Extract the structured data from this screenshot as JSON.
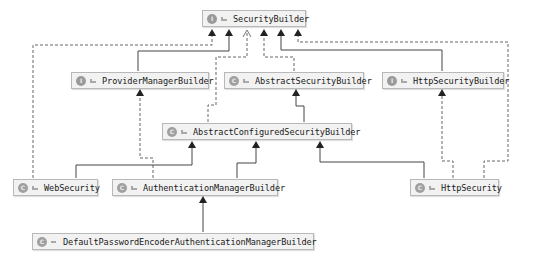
{
  "diagram": {
    "type": "uml-class-hierarchy",
    "colors": {
      "node_bg": "#f2f2f2",
      "node_border": "#b8b8b8",
      "edge": "#333333",
      "dashed_edge": "#555555"
    },
    "nodes": [
      {
        "id": "SecurityBuilder",
        "label": "SecurityBuilder",
        "kind": "interface",
        "kind_glyph": "I"
      },
      {
        "id": "ProviderManagerBuilder",
        "label": "ProviderManagerBuilder",
        "kind": "interface",
        "kind_glyph": "I"
      },
      {
        "id": "AbstractSecurityBuilder",
        "label": "AbstractSecurityBuilder",
        "kind": "abstract-class",
        "kind_glyph": "C"
      },
      {
        "id": "HttpSecurityBuilder",
        "label": "HttpSecurityBuilder",
        "kind": "interface",
        "kind_glyph": "I"
      },
      {
        "id": "AbstractConfiguredSecurityBuilder",
        "label": "AbstractConfiguredSecurityBuilder",
        "kind": "abstract-class",
        "kind_glyph": "C"
      },
      {
        "id": "WebSecurity",
        "label": "WebSecurity",
        "kind": "final-class",
        "kind_glyph": "C"
      },
      {
        "id": "AuthenticationManagerBuilder",
        "label": "AuthenticationManagerBuilder",
        "kind": "class",
        "kind_glyph": "C"
      },
      {
        "id": "HttpSecurity",
        "label": "HttpSecurity",
        "kind": "final-class",
        "kind_glyph": "C"
      },
      {
        "id": "DefaultPasswordEncoderAuthenticationManagerBuilder",
        "label": "DefaultPasswordEncoderAuthenticationManagerBuilder",
        "kind": "inner-class",
        "kind_glyph": "C"
      }
    ],
    "edges": [
      {
        "from": "WebSecurity",
        "to": "SecurityBuilder",
        "relation": "implements",
        "style": "dashed"
      },
      {
        "from": "ProviderManagerBuilder",
        "to": "SecurityBuilder",
        "relation": "extends",
        "style": "solid"
      },
      {
        "from": "AbstractConfiguredSecurityBuilder",
        "to": "SecurityBuilder",
        "relation": "implements",
        "style": "dashed"
      },
      {
        "from": "AbstractSecurityBuilder",
        "to": "SecurityBuilder",
        "relation": "implements",
        "style": "dashed"
      },
      {
        "from": "HttpSecurityBuilder",
        "to": "SecurityBuilder",
        "relation": "extends",
        "style": "solid"
      },
      {
        "from": "HttpSecurity",
        "to": "SecurityBuilder",
        "relation": "implements",
        "style": "dashed"
      },
      {
        "from": "AuthenticationManagerBuilder",
        "to": "ProviderManagerBuilder",
        "relation": "implements",
        "style": "dashed"
      },
      {
        "from": "AbstractConfiguredSecurityBuilder",
        "to": "AbstractSecurityBuilder",
        "relation": "extends",
        "style": "solid"
      },
      {
        "from": "HttpSecurity",
        "to": "HttpSecurityBuilder",
        "relation": "implements",
        "style": "dashed"
      },
      {
        "from": "WebSecurity",
        "to": "AbstractConfiguredSecurityBuilder",
        "relation": "extends",
        "style": "solid"
      },
      {
        "from": "AuthenticationManagerBuilder",
        "to": "AbstractConfiguredSecurityBuilder",
        "relation": "extends",
        "style": "solid"
      },
      {
        "from": "HttpSecurity",
        "to": "AbstractConfiguredSecurityBuilder",
        "relation": "extends",
        "style": "solid"
      },
      {
        "from": "DefaultPasswordEncoderAuthenticationManagerBuilder",
        "to": "AuthenticationManagerBuilder",
        "relation": "extends",
        "style": "solid"
      }
    ]
  }
}
